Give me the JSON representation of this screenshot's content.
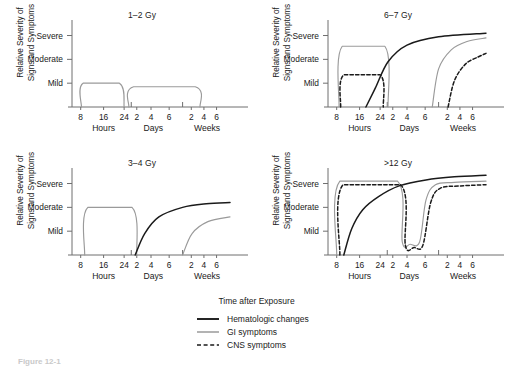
{
  "figure": {
    "x_axis_caption": "Time after Exposure",
    "caption": "Figure 12-1",
    "y_axis_label_line1": "Relative Severity of",
    "y_axis_label_line2": "Signs and Symptoms",
    "y_tick_labels": [
      "Severe",
      "Moderate",
      "Mild"
    ],
    "x_tick_labels": [
      "8",
      "16",
      "24",
      "2",
      "4",
      "6",
      "2",
      "4",
      "6"
    ],
    "x_group_labels": [
      "Hours",
      "Days",
      "Weeks"
    ],
    "colors": {
      "hematologic": "#1a1a1a",
      "gi": "#9a9a9a",
      "cns": "#1a1a1a",
      "axis": "#6e6e6e",
      "background": "#ffffff"
    }
  },
  "legend": {
    "items": [
      {
        "label": "Hematologic changes",
        "style": "solid",
        "color": "#1a1a1a",
        "width": 1.8
      },
      {
        "label": "GI symptoms",
        "style": "solid",
        "color": "#9a9a9a",
        "width": 1.5
      },
      {
        "label": "CNS symptoms",
        "style": "dashed",
        "color": "#1a1a1a",
        "width": 1.5
      }
    ]
  },
  "panels": [
    {
      "id": "dose-1-2-gy",
      "title": "1–2 Gy",
      "position": "top-left",
      "series_present": [
        "gi"
      ],
      "description": "Two low GI plateaus at Mild; no hematologic or CNS curves visible."
    },
    {
      "id": "dose-3-4-gy",
      "title": "3–4 Gy",
      "position": "bottom-left",
      "series_present": [
        "gi",
        "hematologic"
      ],
      "description": "GI plateau at Moderate in first 24h; hematologic curve rises from day 3 to near Moderate; second GI wave rises at week 2."
    },
    {
      "id": "dose-6-7-gy",
      "title": "6–7 Gy",
      "position": "top-right",
      "series_present": [
        "gi",
        "cns",
        "hematologic"
      ],
      "description": "GI plateau between Moderate and Severe; CNS dashed plateau at Mild; hematologic curve rises from 16h past Severe; second GI and CNS waves rise at weeks 1–2."
    },
    {
      "id": "dose-over-12-gy",
      "title": ">12 Gy",
      "position": "bottom-right",
      "series_present": [
        "gi",
        "cns",
        "hematologic"
      ],
      "description": "GI and CNS rise immediately to Severe, drop sharply near day 5, then rise again to Severe by week 1; hematologic curve rises steadily from 8h to Severe."
    }
  ],
  "chart_data": {
    "type": "line",
    "xlabel": "Time after Exposure",
    "ylabel": "Relative Severity of Signs and Symptoms",
    "y_categories": [
      "Mild",
      "Moderate",
      "Severe"
    ],
    "ylim": [
      0,
      3.4
    ],
    "x_tick_labels": [
      "8",
      "16",
      "24",
      "2",
      "4",
      "6",
      "2",
      "4",
      "6"
    ],
    "x_group_labels": [
      "Hours",
      "Days",
      "Weeks"
    ],
    "grid": false,
    "legend_position": "bottom-center",
    "panels": [
      {
        "title": "1–2 Gy",
        "series": [
          {
            "name": "GI symptoms",
            "style": "solid",
            "color": "#9a9a9a",
            "points": [
              [
                0.06,
                0
              ],
              [
                0.07,
                1.0
              ],
              [
                0.3,
                1.0
              ],
              [
                0.33,
                0
              ]
            ]
          },
          {
            "name": "GI symptoms",
            "style": "solid",
            "color": "#9a9a9a",
            "points": [
              [
                0.36,
                0
              ],
              [
                0.39,
                0.85
              ],
              [
                0.78,
                0.85
              ],
              [
                0.81,
                0
              ]
            ]
          }
        ]
      },
      {
        "title": "3–4 Gy",
        "series": [
          {
            "name": "GI symptoms",
            "style": "solid",
            "color": "#9a9a9a",
            "points": [
              [
                0.08,
                0
              ],
              [
                0.1,
                2.0
              ],
              [
                0.38,
                2.0
              ],
              [
                0.41,
                0
              ]
            ]
          },
          {
            "name": "Hematologic changes",
            "style": "solid",
            "color": "#1a1a1a",
            "points": [
              [
                0.4,
                0
              ],
              [
                0.46,
                0.9
              ],
              [
                0.55,
                1.6
              ],
              [
                0.7,
                2.0
              ],
              [
                0.85,
                2.15
              ],
              [
                1.0,
                2.2
              ]
            ]
          },
          {
            "name": "GI symptoms",
            "style": "solid",
            "color": "#9a9a9a",
            "points": [
              [
                0.7,
                0
              ],
              [
                0.76,
                0.9
              ],
              [
                0.86,
                1.4
              ],
              [
                1.0,
                1.6
              ]
            ]
          }
        ]
      },
      {
        "title": "6–7 Gy",
        "series": [
          {
            "name": "GI symptoms",
            "style": "solid",
            "color": "#9a9a9a",
            "points": [
              [
                0.07,
                0
              ],
              [
                0.09,
                2.55
              ],
              [
                0.36,
                2.55
              ],
              [
                0.38,
                0
              ]
            ]
          },
          {
            "name": "CNS symptoms",
            "style": "dashed",
            "color": "#1a1a1a",
            "points": [
              [
                0.08,
                0
              ],
              [
                0.1,
                1.35
              ],
              [
                0.33,
                1.35
              ],
              [
                0.35,
                0
              ]
            ]
          },
          {
            "name": "Hematologic changes",
            "style": "solid",
            "color": "#1a1a1a",
            "points": [
              [
                0.24,
                0
              ],
              [
                0.3,
                0.8
              ],
              [
                0.38,
                1.9
              ],
              [
                0.5,
                2.6
              ],
              [
                0.7,
                2.95
              ],
              [
                1.0,
                3.1
              ]
            ]
          },
          {
            "name": "GI symptoms",
            "style": "solid",
            "color": "#9a9a9a",
            "points": [
              [
                0.66,
                0
              ],
              [
                0.7,
                1.6
              ],
              [
                0.78,
                2.4
              ],
              [
                0.88,
                2.75
              ],
              [
                1.0,
                2.9
              ]
            ]
          },
          {
            "name": "CNS symptoms",
            "style": "dashed",
            "color": "#1a1a1a",
            "points": [
              [
                0.76,
                0
              ],
              [
                0.8,
                1.1
              ],
              [
                0.87,
                1.8
              ],
              [
                0.95,
                2.1
              ],
              [
                1.0,
                2.25
              ]
            ]
          }
        ]
      },
      {
        "title": ">12 Gy",
        "series": [
          {
            "name": "GI symptoms",
            "style": "solid",
            "color": "#9a9a9a",
            "points": [
              [
                0.055,
                0
              ],
              [
                0.075,
                3.1
              ],
              [
                0.44,
                3.1
              ],
              [
                0.47,
                0.55
              ],
              [
                0.52,
                0.45
              ],
              [
                0.58,
                0.55
              ],
              [
                0.62,
                2.3
              ],
              [
                0.68,
                2.95
              ],
              [
                0.8,
                3.05
              ],
              [
                1.0,
                3.1
              ]
            ]
          },
          {
            "name": "CNS symptoms",
            "style": "dashed",
            "color": "#1a1a1a",
            "points": [
              [
                0.075,
                0
              ],
              [
                0.095,
                2.95
              ],
              [
                0.46,
                2.95
              ],
              [
                0.49,
                0.4
              ],
              [
                0.545,
                0.32
              ],
              [
                0.6,
                0.4
              ],
              [
                0.65,
                2.2
              ],
              [
                0.71,
                2.8
              ],
              [
                0.84,
                2.9
              ],
              [
                1.0,
                2.95
              ]
            ]
          },
          {
            "name": "Hematologic changes",
            "style": "solid",
            "color": "#1a1a1a",
            "points": [
              [
                0.1,
                0
              ],
              [
                0.15,
                1.1
              ],
              [
                0.22,
                1.9
              ],
              [
                0.32,
                2.45
              ],
              [
                0.45,
                2.9
              ],
              [
                0.62,
                3.15
              ],
              [
                0.8,
                3.28
              ],
              [
                1.0,
                3.35
              ]
            ]
          }
        ]
      }
    ]
  }
}
